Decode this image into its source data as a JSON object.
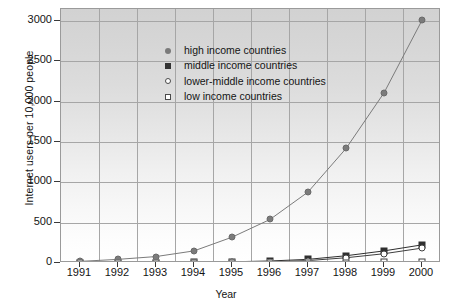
{
  "chart_data": {
    "type": "line",
    "title": "",
    "xlabel": "Year",
    "ylabel": "Internet users per 10,000 people",
    "categories": [
      "1991",
      "1992",
      "1993",
      "1994",
      "1995",
      "1996",
      "1997",
      "1998",
      "1999",
      "2000"
    ],
    "x": [
      1991,
      1992,
      1993,
      1994,
      1995,
      1996,
      1997,
      1998,
      1999,
      2000
    ],
    "ylim": [
      0,
      3150
    ],
    "yticks": [
      0,
      500,
      1000,
      1500,
      2000,
      2500,
      3000
    ],
    "ytick_labels": [
      "0",
      "500",
      "1000",
      "1500",
      "2000",
      "2500",
      "3000"
    ],
    "grid": true,
    "legend_position": "upper-left-inside",
    "series": [
      {
        "name": "high income countries",
        "marker": "filled-circle",
        "color": "#7b7b7b",
        "values": [
          20,
          45,
          80,
          150,
          320,
          540,
          880,
          1420,
          2110,
          3010
        ]
      },
      {
        "name": "middle income countries",
        "marker": "filled-square",
        "color": "#2f2f2f",
        "values": [
          1,
          2,
          4,
          8,
          15,
          25,
          45,
          90,
          150,
          225
        ]
      },
      {
        "name": "lower-middle income countries",
        "marker": "open-circle",
        "color": "#3f3f3f",
        "values": [
          1,
          1,
          2,
          4,
          8,
          15,
          30,
          65,
          115,
          185
        ]
      },
      {
        "name": "low income countries",
        "marker": "open-square",
        "color": "#3f3f3f",
        "values": [
          0,
          0,
          0,
          0,
          1,
          1,
          2,
          4,
          8,
          14
        ]
      }
    ]
  },
  "axes": {
    "y_title": "Internet users per 10,000 people",
    "x_title": "Year"
  },
  "legend": {
    "entries": [
      {
        "label": "high income countries",
        "marker": "filled-circle"
      },
      {
        "label": "middle income countries",
        "marker": "filled-square"
      },
      {
        "label": "lower-middle income countries",
        "marker": "open-circle"
      },
      {
        "label": "low income countries",
        "marker": "open-square"
      }
    ]
  }
}
